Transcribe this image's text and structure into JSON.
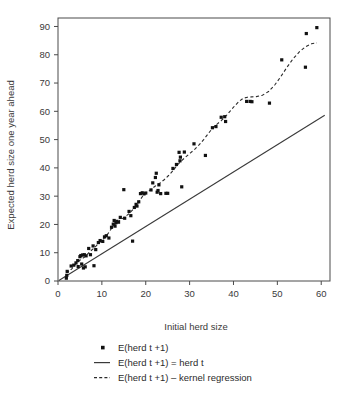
{
  "chart_data": {
    "type": "scatter",
    "title": "",
    "xlabel": "Initial herd size",
    "ylabel": "Expected herd size one year ahead",
    "xlim": [
      0,
      62
    ],
    "ylim": [
      0,
      93
    ],
    "xticks": [
      0,
      10,
      20,
      30,
      40,
      50,
      60
    ],
    "yticks": [
      0,
      10,
      20,
      30,
      40,
      50,
      60,
      70,
      80,
      90
    ],
    "grid": false,
    "legend_position": "below",
    "series": [
      {
        "name": "E(herd t +1)",
        "type": "scatter",
        "marker": "square",
        "color": "#111111",
        "points": [
          [
            1.9,
            1.0
          ],
          [
            2.0,
            2.0
          ],
          [
            2.1,
            3.4
          ],
          [
            3.0,
            5.3
          ],
          [
            3.6,
            5.6
          ],
          [
            4.1,
            6.4
          ],
          [
            4.5,
            7.2
          ],
          [
            4.6,
            5.1
          ],
          [
            5.0,
            8.6
          ],
          [
            5.2,
            9.0
          ],
          [
            5.4,
            6.0
          ],
          [
            5.6,
            9.2
          ],
          [
            5.8,
            4.6
          ],
          [
            6.0,
            9.3
          ],
          [
            6.2,
            5.0
          ],
          [
            6.4,
            8.9
          ],
          [
            7.0,
            11.5
          ],
          [
            7.4,
            9.3
          ],
          [
            8.0,
            12.4
          ],
          [
            8.2,
            5.4
          ],
          [
            8.6,
            11.1
          ],
          [
            9.2,
            13.6
          ],
          [
            9.6,
            14.3
          ],
          [
            10.2,
            14.0
          ],
          [
            10.6,
            15.6
          ],
          [
            11.0,
            16.0
          ],
          [
            11.6,
            15.2
          ],
          [
            12.2,
            19.0
          ],
          [
            12.6,
            20.1
          ],
          [
            12.8,
            21.4
          ],
          [
            13.0,
            19.4
          ],
          [
            13.2,
            20.6
          ],
          [
            13.4,
            21.1
          ],
          [
            13.8,
            20.8
          ],
          [
            14.2,
            22.5
          ],
          [
            15.0,
            32.3
          ],
          [
            15.2,
            22.2
          ],
          [
            16.2,
            24.6
          ],
          [
            16.6,
            23.1
          ],
          [
            17.0,
            14.1
          ],
          [
            17.4,
            26.0
          ],
          [
            17.8,
            27.1
          ],
          [
            18.0,
            26.5
          ],
          [
            18.4,
            28.0
          ],
          [
            18.8,
            30.9
          ],
          [
            19.2,
            31.2
          ],
          [
            19.6,
            30.8
          ],
          [
            20.0,
            31.1
          ],
          [
            21.2,
            32.2
          ],
          [
            21.6,
            34.7
          ],
          [
            22.2,
            36.6
          ],
          [
            22.4,
            38.1
          ],
          [
            22.6,
            31.4
          ],
          [
            22.8,
            32.0
          ],
          [
            23.0,
            34.0
          ],
          [
            23.4,
            30.9
          ],
          [
            24.6,
            31.0
          ],
          [
            25.0,
            31.0
          ],
          [
            26.2,
            39.8
          ],
          [
            27.0,
            41.2
          ],
          [
            27.6,
            45.5
          ],
          [
            27.8,
            42.5
          ],
          [
            27.9,
            43.8
          ],
          [
            28.2,
            33.3
          ],
          [
            28.8,
            45.6
          ],
          [
            31.0,
            48.5
          ],
          [
            33.6,
            44.4
          ],
          [
            35.2,
            54.2
          ],
          [
            36.0,
            54.6
          ],
          [
            37.2,
            57.9
          ],
          [
            38.0,
            58.1
          ],
          [
            38.2,
            56.4
          ],
          [
            43.0,
            63.5
          ],
          [
            43.8,
            63.5
          ],
          [
            44.2,
            63.4
          ],
          [
            48.2,
            62.9
          ],
          [
            51.0,
            78.2
          ],
          [
            56.4,
            75.6
          ],
          [
            56.6,
            87.5
          ],
          [
            59.0,
            89.6
          ]
        ]
      },
      {
        "name": "E(herd t +1) = herd t",
        "type": "line",
        "style": "solid",
        "color": "#3a3a3a",
        "points": [
          [
            0.2,
            0.2
          ],
          [
            60.8,
            58.6
          ]
        ]
      },
      {
        "name": "E(herd t +1) – kernel regression",
        "type": "line",
        "style": "dashed",
        "color": "#2b2b2b",
        "points": [
          [
            1.8,
            3.6
          ],
          [
            2.4,
            3.3
          ],
          [
            3.2,
            4.4
          ],
          [
            4.2,
            6.3
          ],
          [
            5.2,
            7.6
          ],
          [
            6.2,
            8.6
          ],
          [
            7.2,
            10.3
          ],
          [
            8.2,
            11.6
          ],
          [
            9.2,
            13.2
          ],
          [
            10.2,
            14.6
          ],
          [
            11.2,
            16.3
          ],
          [
            12.2,
            18.6
          ],
          [
            13.2,
            20.4
          ],
          [
            14.2,
            21.6
          ],
          [
            15.2,
            22.6
          ],
          [
            16.2,
            23.8
          ],
          [
            17.2,
            25.5
          ],
          [
            18.2,
            27.4
          ],
          [
            19.2,
            29.8
          ],
          [
            20.2,
            31.3
          ],
          [
            21.2,
            32.4
          ],
          [
            22.2,
            33.6
          ],
          [
            23.2,
            34.6
          ],
          [
            24.2,
            35.8
          ],
          [
            25.2,
            37.3
          ],
          [
            26.2,
            39.0
          ],
          [
            27.2,
            41.0
          ],
          [
            28.2,
            42.6
          ],
          [
            29.2,
            44.0
          ],
          [
            30.2,
            45.3
          ],
          [
            31.2,
            46.6
          ],
          [
            32.2,
            48.2
          ],
          [
            33.2,
            50.0
          ],
          [
            34.2,
            52.0
          ],
          [
            35.2,
            54.0
          ],
          [
            36.2,
            55.4
          ],
          [
            37.2,
            56.7
          ],
          [
            38.2,
            58.2
          ],
          [
            39.2,
            60.0
          ],
          [
            40.2,
            61.8
          ],
          [
            41.2,
            63.4
          ],
          [
            42.2,
            64.6
          ],
          [
            43.2,
            65.0
          ],
          [
            44.2,
            65.1
          ],
          [
            45.2,
            65.2
          ],
          [
            46.6,
            65.7
          ],
          [
            48.0,
            67.0
          ],
          [
            49.4,
            69.3
          ],
          [
            50.8,
            72.3
          ],
          [
            52.2,
            75.6
          ],
          [
            53.6,
            78.6
          ],
          [
            55.0,
            81.0
          ],
          [
            56.4,
            82.8
          ],
          [
            57.8,
            83.9
          ],
          [
            59.0,
            84.2
          ]
        ]
      }
    ]
  },
  "axes": {
    "x_title": "Initial herd size",
    "y_title": "Expected herd size one year ahead",
    "x_tick_labels": [
      "0",
      "10",
      "20",
      "30",
      "40",
      "50",
      "60"
    ],
    "y_tick_labels": [
      "0",
      "10",
      "20",
      "30",
      "40",
      "50",
      "60",
      "70",
      "80",
      "90"
    ]
  },
  "legend": {
    "items": [
      {
        "marker": "square-marker",
        "label": "E(herd t +1)"
      },
      {
        "marker": "solid-line-marker",
        "label": "E(herd t +1) = herd t"
      },
      {
        "marker": "dashed-line-marker",
        "label": "E(herd t +1) – kernel regression"
      }
    ]
  },
  "colors": {
    "point": "#111111",
    "identity_line": "#3a3a3a",
    "kernel_line": "#2b2b2b",
    "frame": "#4a4a4a",
    "text": "#3a3a3a",
    "background": "#ffffff"
  }
}
